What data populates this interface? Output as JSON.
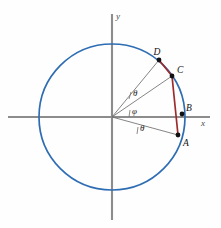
{
  "figure": {
    "background_color": "#fefefe",
    "width": 221,
    "height": 228
  },
  "axes": {
    "x_label": "x",
    "y_label": "y",
    "color": "#8c8c8c",
    "origin": {
      "x": 112,
      "y": 117
    }
  },
  "circle": {
    "color": "#2e6db4",
    "center_x": 112,
    "center_y": 117,
    "radius": 73
  },
  "chord": {
    "color": "#9e2b2b",
    "path_labels": "D-C-A"
  },
  "points": [
    {
      "id": "A",
      "label": "A",
      "x": 178,
      "y": 135,
      "label_x": 183,
      "label_y": 144,
      "angle_deg": -15
    },
    {
      "id": "B",
      "label": "B",
      "x": 182,
      "y": 114,
      "label_x": 184,
      "label_y": 110,
      "angle_deg": 2
    },
    {
      "id": "C",
      "label": "C",
      "x": 172,
      "y": 76,
      "label_x": 177,
      "label_y": 73,
      "angle_deg": 34
    },
    {
      "id": "D",
      "label": "D",
      "x": 159,
      "y": 60,
      "label_x": 159,
      "label_y": 54,
      "angle_deg": 51
    }
  ],
  "angles": [
    {
      "id": "theta-upper",
      "label": "θ",
      "label_x": 131,
      "label_y": 95,
      "between": "OD and OC"
    },
    {
      "id": "phi",
      "label": "φ",
      "label_x": 131,
      "label_y": 113,
      "between": "OC and x-axis"
    },
    {
      "id": "theta-lower",
      "label": "θ",
      "label_x": 139,
      "label_y": 131,
      "between": "x-axis and OA"
    }
  ],
  "colors": {
    "circle_blue": "#2e6db4",
    "chord_red": "#9e2b2b",
    "axis_gray": "#8c8c8c",
    "radius_gray": "#6f6f6f",
    "point_black": "#111111"
  }
}
